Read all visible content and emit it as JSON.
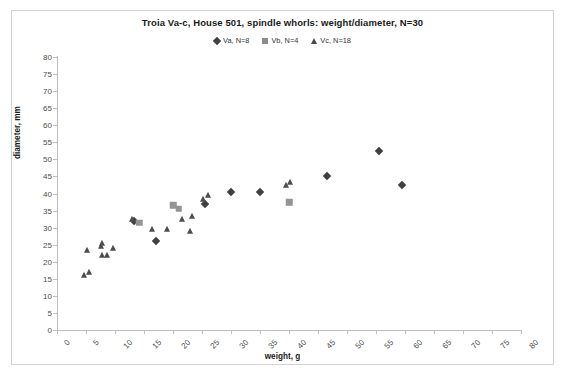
{
  "chart_data": {
    "type": "scatter",
    "title": "Troia Va-c, House 501, spindle whorls:  weight/diameter, N=30",
    "xlabel": "weight, g",
    "ylabel": "diameter, mm",
    "xlim": [
      0,
      80
    ],
    "ylim": [
      0,
      80
    ],
    "xticks": [
      0,
      5,
      10,
      15,
      20,
      25,
      30,
      35,
      40,
      45,
      50,
      55,
      60,
      65,
      70,
      75,
      80
    ],
    "yticks": [
      0,
      5,
      10,
      15,
      20,
      25,
      30,
      35,
      40,
      45,
      50,
      55,
      60,
      65,
      70,
      75,
      80
    ],
    "grid": false,
    "legend_position": "top-center",
    "series": [
      {
        "name": "Va, N=8",
        "marker": "diamond",
        "color": "#404040",
        "points": [
          {
            "x": 13.2,
            "y": 32.0
          },
          {
            "x": 17.0,
            "y": 26.0
          },
          {
            "x": 30.0,
            "y": 40.5
          },
          {
            "x": 35.0,
            "y": 40.5
          },
          {
            "x": 46.5,
            "y": 45.0
          },
          {
            "x": 55.5,
            "y": 52.5
          },
          {
            "x": 59.5,
            "y": 42.5
          },
          {
            "x": 25.5,
            "y": 37.0
          }
        ]
      },
      {
        "name": "Vb, N=4",
        "marker": "square",
        "color": "#949494",
        "points": [
          {
            "x": 14.2,
            "y": 31.5
          },
          {
            "x": 20.0,
            "y": 36.5
          },
          {
            "x": 21.0,
            "y": 35.5
          },
          {
            "x": 40.0,
            "y": 37.5
          }
        ]
      },
      {
        "name": "Vc, N=18",
        "marker": "triangle",
        "color": "#4d4d4d",
        "points": [
          {
            "x": 4.6,
            "y": 16.0
          },
          {
            "x": 5.6,
            "y": 17.0
          },
          {
            "x": 5.2,
            "y": 23.5
          },
          {
            "x": 7.6,
            "y": 24.5
          },
          {
            "x": 7.8,
            "y": 25.5
          },
          {
            "x": 7.7,
            "y": 22.0
          },
          {
            "x": 8.6,
            "y": 22.0
          },
          {
            "x": 9.6,
            "y": 24.0
          },
          {
            "x": 13.0,
            "y": 32.5
          },
          {
            "x": 16.4,
            "y": 29.5
          },
          {
            "x": 19.0,
            "y": 29.5
          },
          {
            "x": 21.5,
            "y": 32.5
          },
          {
            "x": 23.2,
            "y": 33.5
          },
          {
            "x": 23.0,
            "y": 29.0
          },
          {
            "x": 25.2,
            "y": 38.5
          },
          {
            "x": 26.0,
            "y": 39.5
          },
          {
            "x": 39.4,
            "y": 42.5
          },
          {
            "x": 40.2,
            "y": 43.5
          }
        ]
      }
    ]
  },
  "legend": {
    "entries": [
      {
        "label": "Va, N=8",
        "marker": "diamond"
      },
      {
        "label": "Vb, N=4",
        "marker": "square"
      },
      {
        "label": "Vc, N=18",
        "marker": "triangle"
      }
    ]
  }
}
